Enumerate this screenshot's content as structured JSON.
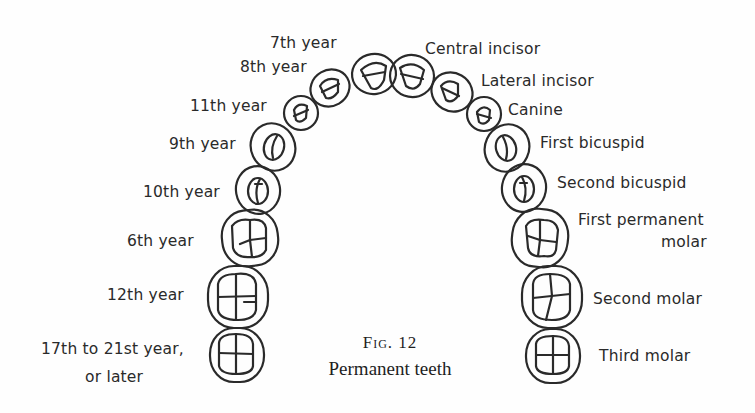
{
  "figure": {
    "number_label": "Fig. 12",
    "caption": "Permanent teeth"
  },
  "left_labels": [
    {
      "id": "central",
      "text": "7th year"
    },
    {
      "id": "lateral",
      "text": "8th year"
    },
    {
      "id": "canine",
      "text": "11th year"
    },
    {
      "id": "first-bicuspid",
      "text": "9th year"
    },
    {
      "id": "second-bicuspid",
      "text": "10th year"
    },
    {
      "id": "first-molar",
      "text": "6th year"
    },
    {
      "id": "second-molar",
      "text": "12th year"
    },
    {
      "id": "third-molar",
      "text_line1": "17th to 21st year,",
      "text_line2": "or later"
    }
  ],
  "right_labels": [
    {
      "id": "central",
      "text": "Central incisor"
    },
    {
      "id": "lateral",
      "text": "Lateral incisor"
    },
    {
      "id": "canine",
      "text": "Canine"
    },
    {
      "id": "first-bicuspid",
      "text": "First bicuspid"
    },
    {
      "id": "second-bicuspid",
      "text": "Second bicuspid"
    },
    {
      "id": "first-molar",
      "text_line1": "First permanent",
      "text_line2": "molar"
    },
    {
      "id": "second-molar",
      "text": "Second molar"
    },
    {
      "id": "third-molar",
      "text": "Third molar"
    }
  ],
  "colors": {
    "ink": "#2a2a2a",
    "paper": "#fefefe"
  }
}
